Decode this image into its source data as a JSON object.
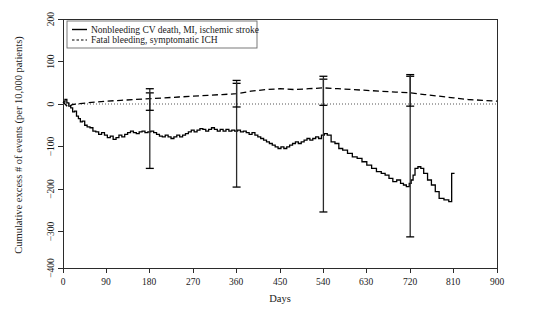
{
  "chart_data": {
    "type": "line",
    "title": "",
    "xlabel": "Days",
    "ylabel": "Cumulative excess # of events (per 10,000 patients)",
    "xlim": [
      0,
      900
    ],
    "ylim": [
      -400,
      200
    ],
    "xticks": [
      0,
      90,
      180,
      270,
      360,
      450,
      540,
      630,
      720,
      810,
      900
    ],
    "yticks": [
      200,
      100,
      0,
      -100,
      -200,
      -300,
      -400
    ],
    "grid": false,
    "zero_reference_line": 0,
    "legend": {
      "position": "top-left",
      "entries": [
        {
          "label": "Nonbleeding CV death, MI, ischemic stroke",
          "style": "solid"
        },
        {
          "label": "Fatal bleeding, symptomatic ICH",
          "style": "dashed"
        }
      ]
    },
    "series": [
      {
        "name": "Nonbleeding CV death, MI, ischemic stroke",
        "style": "solid",
        "x": [
          0,
          4,
          8,
          12,
          16,
          20,
          24,
          28,
          32,
          36,
          40,
          45,
          50,
          56,
          62,
          68,
          74,
          80,
          86,
          92,
          98,
          104,
          110,
          116,
          122,
          128,
          134,
          140,
          146,
          152,
          158,
          164,
          170,
          176,
          182,
          188,
          194,
          200,
          206,
          212,
          218,
          224,
          230,
          236,
          242,
          248,
          254,
          260,
          266,
          272,
          278,
          284,
          290,
          296,
          302,
          308,
          314,
          320,
          326,
          332,
          338,
          344,
          350,
          356,
          362,
          368,
          374,
          380,
          386,
          392,
          398,
          404,
          410,
          416,
          422,
          428,
          434,
          440,
          446,
          452,
          458,
          464,
          470,
          476,
          482,
          488,
          494,
          500,
          506,
          512,
          518,
          524,
          530,
          536,
          542,
          548,
          556,
          564,
          572,
          580,
          590,
          600,
          610,
          620,
          630,
          640,
          650,
          660,
          668,
          676,
          684,
          692,
          700,
          706,
          712,
          718,
          722,
          726,
          730,
          736,
          742,
          748,
          756,
          764,
          772,
          780,
          790,
          800,
          806,
          812
        ],
        "y": [
          0,
          6,
          -2,
          -10,
          -14,
          -24,
          -22,
          -34,
          -40,
          -48,
          -46,
          -56,
          -60,
          -62,
          -70,
          -72,
          -78,
          -74,
          -80,
          -86,
          -82,
          -90,
          -86,
          -80,
          -84,
          -78,
          -74,
          -70,
          -74,
          -76,
          -72,
          -70,
          -74,
          -72,
          -70,
          -74,
          -78,
          -82,
          -84,
          -80,
          -84,
          -88,
          -84,
          -80,
          -84,
          -80,
          -76,
          -72,
          -68,
          -72,
          -68,
          -64,
          -66,
          -70,
          -66,
          -62,
          -66,
          -70,
          -66,
          -70,
          -66,
          -70,
          -68,
          -70,
          -68,
          -72,
          -70,
          -74,
          -78,
          -74,
          -80,
          -84,
          -88,
          -92,
          -96,
          -100,
          -104,
          -108,
          -112,
          -108,
          -112,
          -108,
          -104,
          -100,
          -96,
          -100,
          -96,
          -92,
          -88,
          -92,
          -88,
          -84,
          -88,
          -80,
          -76,
          -80,
          -96,
          -100,
          -112,
          -116,
          -124,
          -132,
          -136,
          -144,
          -152,
          -160,
          -168,
          -172,
          -176,
          -184,
          -192,
          -188,
          -196,
          -200,
          -204,
          -196,
          -188,
          -176,
          -160,
          -156,
          -160,
          -172,
          -188,
          -200,
          -216,
          -232,
          -236,
          -240,
          -172,
          -172
        ]
      },
      {
        "name": "Fatal bleeding, symptomatic ICH",
        "style": "dashed",
        "x": [
          0,
          10,
          20,
          35,
          50,
          70,
          90,
          120,
          150,
          180,
          210,
          240,
          270,
          300,
          330,
          360,
          390,
          420,
          450,
          480,
          510,
          540,
          570,
          600,
          630,
          660,
          690,
          720,
          750,
          780,
          810,
          840,
          870,
          900
        ],
        "y": [
          0,
          -12,
          -6,
          -4,
          -2,
          0,
          2,
          4,
          6,
          8,
          10,
          12,
          14,
          16,
          18,
          20,
          26,
          30,
          32,
          30,
          32,
          34,
          32,
          30,
          28,
          26,
          24,
          22,
          18,
          14,
          10,
          6,
          4,
          2
        ]
      }
    ],
    "error_bars": [
      {
        "series": "Nonbleeding CV death, MI, ischemic stroke",
        "x": 180,
        "y": -70,
        "low": -160,
        "high": 22
      },
      {
        "series": "Nonbleeding CV death, MI, ischemic stroke",
        "x": 360,
        "y": -68,
        "low": -205,
        "high": 45
      },
      {
        "series": "Nonbleeding CV death, MI, ischemic stroke",
        "x": 540,
        "y": -96,
        "low": -265,
        "high": 55
      },
      {
        "series": "Nonbleeding CV death, MI, ischemic stroke",
        "x": 720,
        "y": -160,
        "low": -325,
        "high": 62
      },
      {
        "series": "Fatal bleeding, symptomatic ICH",
        "x": 180,
        "y": 8,
        "low": -20,
        "high": 32
      },
      {
        "series": "Fatal bleeding, symptomatic ICH",
        "x": 360,
        "y": 20,
        "low": -12,
        "high": 52
      },
      {
        "series": "Fatal bleeding, symptomatic ICH",
        "x": 540,
        "y": 34,
        "low": -8,
        "high": 62
      },
      {
        "series": "Fatal bleeding, symptomatic ICH",
        "x": 720,
        "y": 22,
        "low": -10,
        "high": 66
      }
    ]
  },
  "axes": {
    "x_tick_labels": [
      "0",
      "90",
      "180",
      "270",
      "360",
      "450",
      "540",
      "630",
      "720",
      "810",
      "900"
    ],
    "y_tick_labels": [
      "200",
      "100",
      "0",
      "−100",
      "−200",
      "−300",
      "−400"
    ],
    "x_axis_title": "Days",
    "y_axis_title": "Cumulative excess # of events (per 10,000 patients)"
  },
  "legend": {
    "item_1_label": "Nonbleeding CV death, MI, ischemic stroke",
    "item_2_label": "Fatal bleeding, symptomatic ICH"
  },
  "colors": {
    "series_solid": "#000000",
    "series_dashed": "#000000",
    "axis": "#2b2b2b",
    "zero_line": "#555555",
    "background": "#ffffff"
  }
}
